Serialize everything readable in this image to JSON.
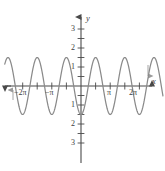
{
  "figure": {
    "name": "trigonometric-graph",
    "background_color": "#ffffff",
    "curve_color": "#8a8a8a",
    "axis_color": "#4a4a4a",
    "label_color": "#3d3d3d"
  },
  "axes": {
    "x_axis_label": "x",
    "y_axis_label": "y",
    "x_tick_labels": [
      {
        "text": "−2π",
        "x_value": -6.2832,
        "px": 22,
        "py": 95
      },
      {
        "text": "−π",
        "x_value": -3.1416,
        "px": 50,
        "py": 95
      },
      {
        "text": "π",
        "x_value": 3.1416,
        "px": 108,
        "py": 95
      },
      {
        "text": "2π",
        "x_value": 6.2832,
        "px": 133,
        "py": 95
      }
    ],
    "y_tick_labels": [
      {
        "text": "3",
        "y_value": 3,
        "px": 72,
        "py": 29
      },
      {
        "text": "2",
        "y_value": 2,
        "px": 72,
        "py": 48
      },
      {
        "text": "1",
        "y_value": 1,
        "px": 72,
        "py": 67
      },
      {
        "text": "1",
        "y_value": -1,
        "px": 72,
        "py": 105
      },
      {
        "text": "2",
        "y_value": -2,
        "px": 72,
        "py": 124
      },
      {
        "text": "3",
        "y_value": -3,
        "px": 72,
        "py": 143
      }
    ],
    "origin_px": {
      "x": 81,
      "y": 86
    },
    "x_range": [
      -8.2,
      8.9
    ],
    "y_range": [
      -3.9,
      3.9
    ],
    "grid": false,
    "legend": "none"
  },
  "chart_data": {
    "type": "line",
    "title": "",
    "subtitle": "",
    "xlabel": "x",
    "ylabel": "y",
    "xlim": [
      -8.2,
      8.9
    ],
    "ylim": [
      -3.9,
      3.9
    ],
    "grid": false,
    "legend_position": "none",
    "xticks": [
      -6.2832,
      -3.1416,
      3.1416,
      6.2832
    ],
    "xticklabels": [
      "−2π",
      "−π",
      "π",
      "2π"
    ],
    "yticks": [
      -3,
      -2,
      -1,
      1,
      2,
      3
    ],
    "yticklabels": [
      "3",
      "2",
      "1",
      "1",
      "2",
      "3"
    ],
    "series": [
      {
        "name": "y = -3 cos(2x)",
        "amplitude": 3,
        "period": 3.1416,
        "function": "-3*cos(2*x)",
        "color": "#8a8a8a",
        "maxima_x": [
          -5.4978,
          -3.927,
          -2.3562,
          -0.7854,
          0.7854,
          2.3562,
          3.927,
          5.4978,
          7.0686
        ],
        "maxima_y": 3,
        "minima_x": [
          -6.2832,
          -4.7124,
          -3.1416,
          -1.5708,
          0,
          1.5708,
          3.1416,
          4.7124,
          6.2832,
          7.854
        ],
        "minima_y": -3,
        "zero_crossings": [
          -5.8905,
          -5.1051,
          -4.3197,
          -3.5343,
          -2.7489,
          -1.9635,
          -1.1781,
          -0.3927,
          0.3927,
          1.1781,
          1.9635,
          2.7489,
          3.5343,
          4.3197,
          5.1051,
          5.8905,
          6.6759,
          7.4613
        ]
      }
    ]
  }
}
